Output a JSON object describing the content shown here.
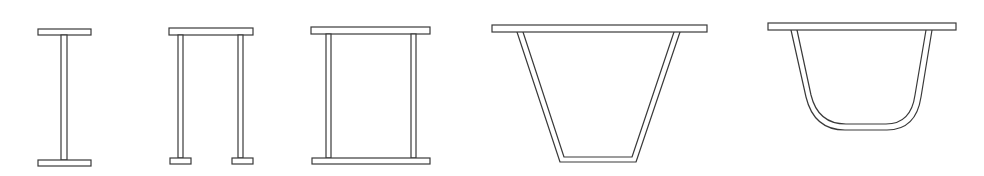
{
  "figure": {
    "line_color": "#3a3a3a",
    "background": "#ffffff",
    "sections": [
      {
        "id": "i-beam",
        "label": "I-section"
      },
      {
        "id": "pi-section",
        "label": "Pi-section with two webs and bottom pads"
      },
      {
        "id": "box-section",
        "label": "Rectangular box section"
      },
      {
        "id": "trapezoidal-section",
        "label": "Trapezoidal box section"
      },
      {
        "id": "u-section",
        "label": "Rounded U/trough section"
      }
    ]
  }
}
